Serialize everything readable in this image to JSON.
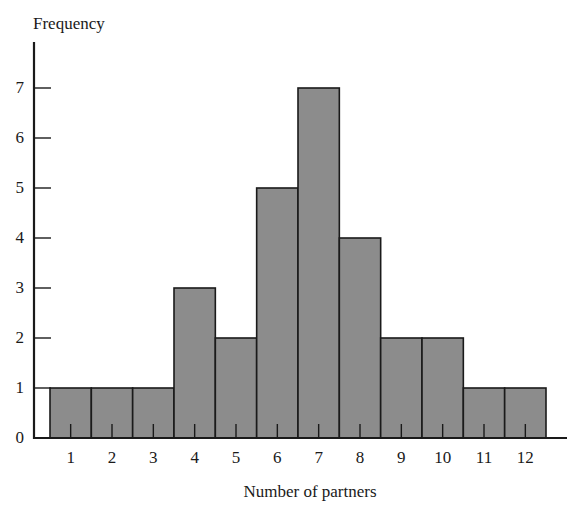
{
  "chart_data": {
    "type": "bar",
    "title": "",
    "xlabel": "Number of partners",
    "ylabel": "Frequency",
    "categories": [
      "1",
      "2",
      "3",
      "4",
      "5",
      "6",
      "7",
      "8",
      "9",
      "10",
      "11",
      "12"
    ],
    "values": [
      1,
      1,
      1,
      3,
      2,
      5,
      7,
      4,
      2,
      2,
      1,
      1
    ],
    "yticks": [
      "0",
      "1",
      "2",
      "3",
      "4",
      "5",
      "6",
      "7"
    ],
    "ylim": [
      0,
      7.9
    ],
    "grid": false,
    "legend": null,
    "bar_color": "#8c8c8c",
    "edge_color": "#1a1a1a",
    "histogram": true
  }
}
